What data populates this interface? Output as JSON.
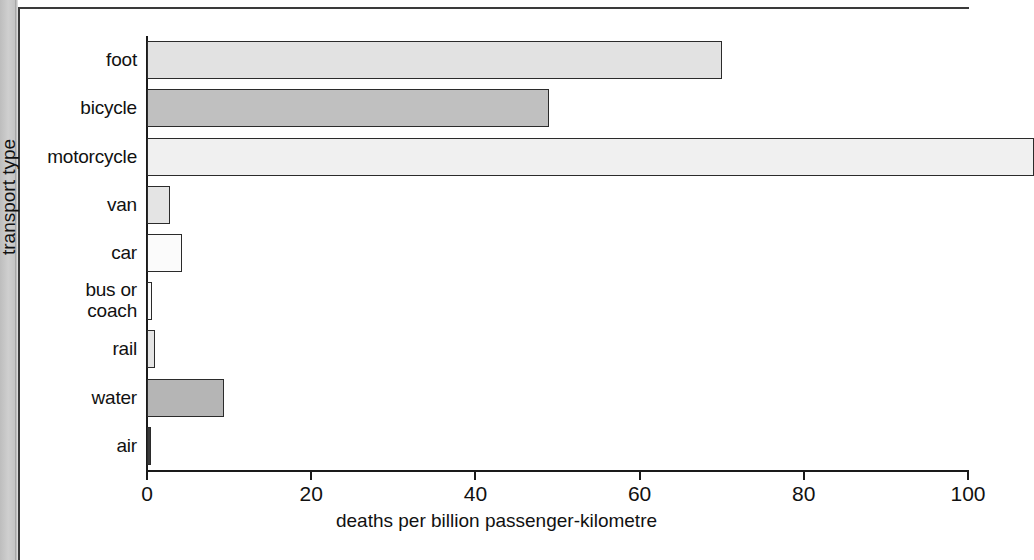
{
  "page": {
    "background_color": "#ffffff",
    "gutter_color": "#c9c9c9",
    "frame_color": "#3a3a3a"
  },
  "chart_data": {
    "type": "bar",
    "orientation": "horizontal",
    "title": "",
    "xlabel": "deaths per billion passenger-kilometre",
    "ylabel": "transport type",
    "categories": [
      "foot",
      "bicycle",
      "motorcycle",
      "van",
      "car",
      "bus or coach",
      "rail",
      "water",
      "air"
    ],
    "values": [
      70,
      49,
      108,
      2.8,
      4.3,
      0.6,
      1.0,
      9.4,
      0.3
    ],
    "value_notes": {
      "motorcycle": "bar runs off the right edge of the visible image; value exceeds 100"
    },
    "xlim": [
      0,
      100
    ],
    "xticks": [
      0,
      20,
      40,
      60,
      80,
      100
    ],
    "xticklabels": [
      "0",
      "20",
      "40",
      "60",
      "80",
      "100"
    ],
    "grid": false,
    "legend": false,
    "bar_colors": [
      "#e2e2e2",
      "#c0c0c0",
      "#f0f0f0",
      "#e4e4e4",
      "#fbfbfb",
      "#fbfbfb",
      "#e4e4e4",
      "#b5b5b5",
      "#3a3a3a"
    ],
    "bar_edge_color": "#2b2b2b"
  }
}
